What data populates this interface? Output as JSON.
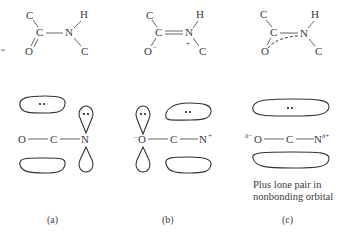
{
  "figure": {
    "panels": [
      {
        "id": "a",
        "label": "(a)",
        "structure": {
          "atoms": [
            "C",
            "C",
            "O",
            "N",
            "H",
            "C"
          ],
          "bonds": "single C–N, double C=O",
          "charges": {}
        },
        "orbital": {
          "atoms": [
            "O",
            "C",
            "N"
          ],
          "description": "pi orbital over O–C with lone pair; p orbital on N with lone pair"
        }
      },
      {
        "id": "b",
        "label": "(b)",
        "structure": {
          "atoms": [
            "C",
            "C",
            "O",
            "N",
            "H",
            "C"
          ],
          "bonds": "double C=N, single C–O",
          "charges": {
            "O": "−",
            "N": "+"
          }
        },
        "orbital": {
          "atoms": [
            "O",
            "C",
            "N"
          ],
          "n_charge": "+",
          "o_charge": "−",
          "description": "p orbital on O with lone pair; pi orbital over C–N with lone pair"
        }
      },
      {
        "id": "c",
        "label": "(c)",
        "structure": {
          "atoms": [
            "C",
            "C",
            "O",
            "N",
            "H",
            "C"
          ],
          "bonds": "resonance hybrid with dashed delocalized O–C–N bond",
          "charges": {}
        },
        "orbital": {
          "atoms": [
            "O",
            "C",
            "N"
          ],
          "o_partial": "δ−",
          "n_partial": "δ+",
          "description": "delocalized three-center pi orbital"
        },
        "note_line1": "Plus lone pair in",
        "note_line2": "nonbonding orbital"
      }
    ],
    "text": {
      "C": "C",
      "O": "O",
      "N": "N",
      "H": "H",
      "minus": "−",
      "plus": "+",
      "delta_minus": "δ−",
      "delta_plus": "δ+",
      "dots": "••"
    }
  }
}
